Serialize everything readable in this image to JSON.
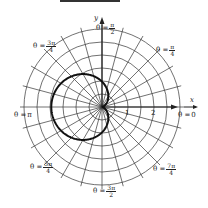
{
  "figure": {
    "title_bar": "",
    "axes": {
      "x_label": "x",
      "y_label": "y"
    },
    "tick_labels": [
      "1",
      "2"
    ],
    "angle_labels": [
      {
        "id": "0",
        "prefix": "θ = ",
        "text": "0"
      },
      {
        "id": "pi4",
        "prefix": "θ = ",
        "num": "π",
        "den": "4"
      },
      {
        "id": "pi2",
        "prefix": "θ = ",
        "num": "π",
        "den": "2"
      },
      {
        "id": "3pi4",
        "prefix": "θ = ",
        "num": "3π",
        "den": "4"
      },
      {
        "id": "pi",
        "prefix": "θ = ",
        "text": "π"
      },
      {
        "id": "5pi4",
        "prefix": "θ = ",
        "num": "5π",
        "den": "4"
      },
      {
        "id": "3pi2",
        "prefix": "θ = ",
        "num": "3π",
        "den": "2"
      },
      {
        "id": "7pi4",
        "prefix": "θ = ",
        "num": "7π",
        "den": "4"
      }
    ],
    "grid": {
      "circles": 6,
      "radial_step_deg": 15,
      "unit_px": 13
    },
    "curve": {
      "equation": "r = 1 - cos θ",
      "color": "#111111",
      "stroke_width": 2
    },
    "colors": {
      "grid": "#333333",
      "axis": "#222222",
      "background": "#ffffff"
    }
  }
}
